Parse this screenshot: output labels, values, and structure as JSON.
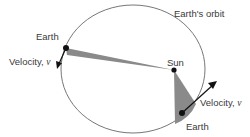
{
  "diagram": {
    "labels": {
      "orbit": "Earth's orbit",
      "sun": "Sun",
      "earth_left": "Earth",
      "earth_right": "Earth",
      "velocity_left": "Velocity, ",
      "velocity_right": "Velocity, ",
      "velocity_symbol": "v⃗"
    },
    "colors": {
      "orbit": "#777777",
      "sector": "#8a8a8a",
      "point": "#111111",
      "text": "#3a3a3a"
    },
    "geometry": {
      "ellipse": {
        "cx": 133,
        "cy": 69,
        "rx": 72,
        "ry": 64
      },
      "sun": {
        "x": 174,
        "y": 70
      },
      "earth_left": {
        "x": 66,
        "y": 48
      },
      "earth_right": {
        "x": 182,
        "y": 113
      }
    }
  }
}
